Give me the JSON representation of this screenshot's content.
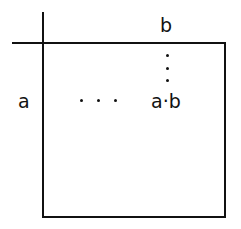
{
  "diagram": {
    "type": "multiplication-table",
    "column_header": "b",
    "row_header": "a",
    "cell": "a·b",
    "horizontal_ellipsis": "...",
    "vertical_ellipsis": "⋮"
  }
}
